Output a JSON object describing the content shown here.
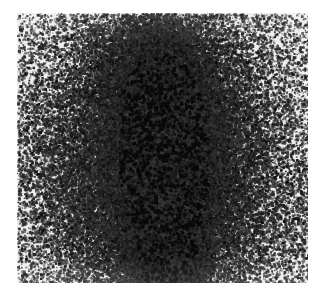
{
  "image": {
    "kind": "scintigram-dot-density-scan",
    "width_px": 325,
    "height_px": 295,
    "page_background_color": "#ffffff",
    "alt_text": "Grayscale dot-density scintigraphy scan showing a vertically elongated hot spot of high tracer uptake in the centre of a light grey rectangular field"
  },
  "plate": {
    "label": "scan-field",
    "x": 17,
    "y": 13,
    "width": 291,
    "height": 270,
    "background_color": "#ebebeb",
    "dot_color": "#121212",
    "border": "none"
  },
  "chart_data": {
    "type": "heatmap",
    "title": "",
    "subtitle": "",
    "xlabel": "",
    "ylabel": "",
    "grid": false,
    "legend": "none",
    "rendering": "stochastic-dot-density",
    "xlim": [
      0,
      291
    ],
    "ylim": [
      0,
      270
    ],
    "background_level": 0.035,
    "dot_size_px": [
      1,
      3
    ],
    "noise_seed": 20240517,
    "hot_spots": [
      {
        "name": "primary-uptake-core",
        "cx": 148,
        "cy": 165,
        "rx": 44,
        "ry": 88,
        "intensity": 1.0
      },
      {
        "name": "upper-extension",
        "cx": 140,
        "cy": 70,
        "rx": 52,
        "ry": 62,
        "intensity": 0.62
      },
      {
        "name": "mid-body-halo",
        "cx": 145,
        "cy": 150,
        "rx": 92,
        "ry": 118,
        "intensity": 0.44
      },
      {
        "name": "lower-focal-hotspot",
        "cx": 150,
        "cy": 247,
        "rx": 30,
        "ry": 32,
        "intensity": 0.88
      },
      {
        "name": "inferior-dense-nodule",
        "cx": 143,
        "cy": 262,
        "rx": 16,
        "ry": 16,
        "intensity": 1.0
      },
      {
        "name": "broad-diffuse-field",
        "cx": 140,
        "cy": 160,
        "rx": 140,
        "ry": 165,
        "intensity": 0.17
      }
    ],
    "scatter_speckles": {
      "name": "background-emulsion-grain",
      "count": 2600,
      "size_px": [
        1,
        2
      ],
      "opacity": [
        0.25,
        0.9
      ]
    }
  }
}
